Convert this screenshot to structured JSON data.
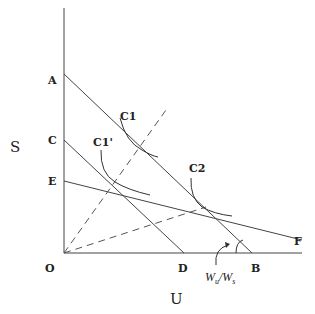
{
  "axes": {
    "y_label": "S",
    "x_label": "U",
    "origin_label": "O"
  },
  "points": {
    "A": "A",
    "C": "C",
    "E": "E",
    "D": "D",
    "B": "B",
    "F": "F"
  },
  "curves": {
    "c1": "C1",
    "c1_prime": "C1'",
    "c2": "C2"
  },
  "annotation": {
    "slope_main": "W",
    "slope_sub_u": "u",
    "slope_slash": "/",
    "slope_sub_s": "s"
  }
}
